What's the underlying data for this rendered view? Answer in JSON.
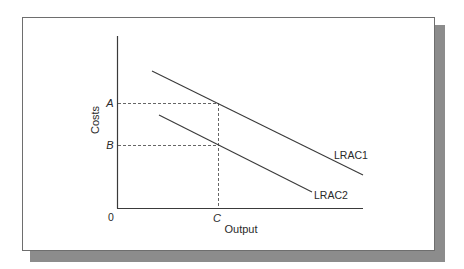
{
  "diagram": {
    "type": "economics-cost-curves",
    "axes": {
      "x_label": "Output",
      "y_label": "Costs",
      "origin_label": "0"
    },
    "y_ticks": [
      {
        "label": "A",
        "meaning": "cost on LRAC1 at output C"
      },
      {
        "label": "B",
        "meaning": "cost on LRAC2 at output C"
      }
    ],
    "x_ticks": [
      {
        "label": "C",
        "meaning": "output level"
      }
    ],
    "curves": [
      {
        "name": "LRAC1",
        "label": "LRAC1",
        "shape": "downward-sloping line",
        "position": "upper"
      },
      {
        "name": "LRAC2",
        "label": "LRAC2",
        "shape": "downward-sloping line",
        "position": "lower"
      }
    ],
    "guides": [
      {
        "from": "A",
        "to": "LRAC1 at C",
        "style": "dashed horizontal"
      },
      {
        "from": "B",
        "to": "LRAC2 at C",
        "style": "dashed horizontal"
      },
      {
        "from": "C",
        "to": "LRAC1",
        "style": "dashed vertical"
      }
    ],
    "colors": {
      "line": "#3a3a3a",
      "dashed": "#555555",
      "frame": "#6e6e6e",
      "shadow": "#8c8c8c"
    }
  }
}
